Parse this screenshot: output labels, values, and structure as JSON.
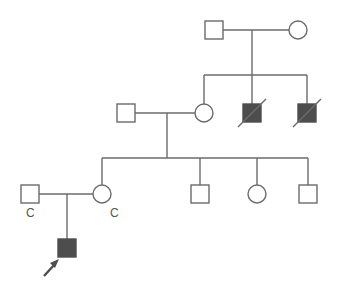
{
  "diagram": {
    "type": "pedigree",
    "colors": {
      "line": "#6b6b6b",
      "affected_fill": "#4d4d4d",
      "unaffected_fill": "#ffffff"
    },
    "generations": [
      {
        "level": 1,
        "individuals": [
          {
            "id": "I-1",
            "sex": "male",
            "affected": false,
            "deceased": false
          },
          {
            "id": "I-2",
            "sex": "female",
            "affected": false,
            "deceased": false
          }
        ]
      },
      {
        "level": 2,
        "individuals": [
          {
            "id": "II-1",
            "sex": "male",
            "affected": false,
            "deceased": false,
            "married_in": true
          },
          {
            "id": "II-2",
            "sex": "female",
            "affected": false,
            "deceased": false
          },
          {
            "id": "II-3",
            "sex": "male",
            "affected": true,
            "deceased": true
          },
          {
            "id": "II-4",
            "sex": "male",
            "affected": true,
            "deceased": true
          }
        ]
      },
      {
        "level": 3,
        "individuals": [
          {
            "id": "III-0",
            "sex": "male",
            "affected": false,
            "deceased": false,
            "married_in": true,
            "label": "C"
          },
          {
            "id": "III-1",
            "sex": "female",
            "affected": false,
            "deceased": false,
            "label": "C"
          },
          {
            "id": "III-2",
            "sex": "male",
            "affected": false,
            "deceased": false
          },
          {
            "id": "III-3",
            "sex": "female",
            "affected": false,
            "deceased": false
          },
          {
            "id": "III-4",
            "sex": "male",
            "affected": false,
            "deceased": false
          }
        ]
      },
      {
        "level": 4,
        "individuals": [
          {
            "id": "IV-1",
            "sex": "male",
            "affected": true,
            "deceased": false,
            "proband": true
          }
        ]
      }
    ],
    "labels": {
      "carrier_father": "C",
      "carrier_mother": "C"
    },
    "proband_arrow": "arrow-icon"
  }
}
